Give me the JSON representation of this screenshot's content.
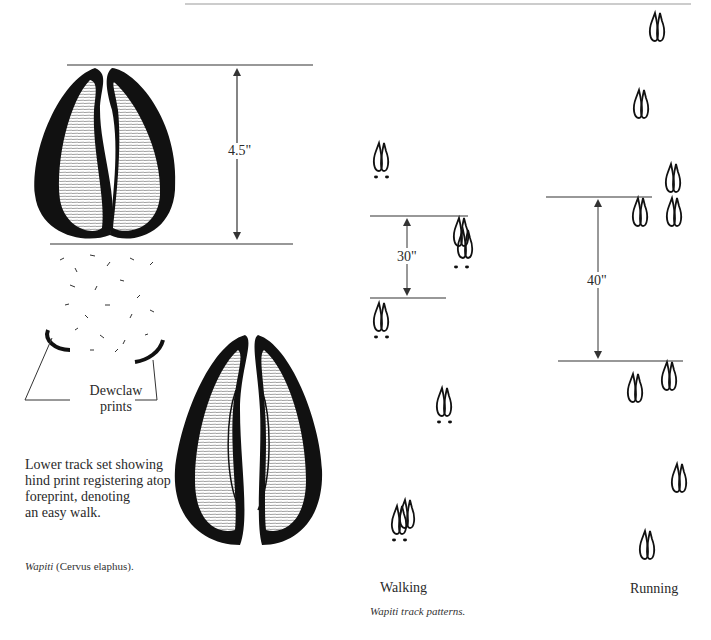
{
  "figure": {
    "hoof_length_label": "4.5\"",
    "dewclaw_label_line1": "Dewclaw",
    "dewclaw_label_line2": "prints",
    "description_lines": [
      "Lower track set showing",
      "hind print registering atop",
      "foreprint, denoting",
      "an easy walk."
    ],
    "caption_italic": "Wapiti",
    "caption_rest": " (Cervus elaphus)."
  },
  "track_patterns": {
    "walking_stride_label": "30\"",
    "running_stride_label": "40\"",
    "walking_label": "Walking",
    "running_label": "Running",
    "caption": "Wapiti track patterns."
  },
  "colors": {
    "ink": "#111111",
    "line": "#333333",
    "rule": "#9a9a9a"
  }
}
